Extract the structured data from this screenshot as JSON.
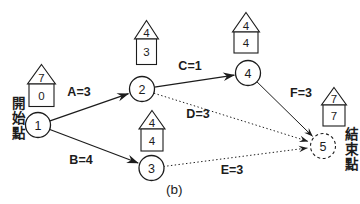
{
  "diagram": {
    "caption": "(b)",
    "start_point_label": "開始點",
    "end_point_label": "結束點",
    "colors": {
      "ink": "#1c1c1c",
      "background": "#ffffff"
    },
    "nodes": [
      {
        "id": "1",
        "house_roof_value": "7",
        "house_body_value": "0",
        "role": "start"
      },
      {
        "id": "2",
        "house_roof_value": "4",
        "house_body_value": "3",
        "role": "intermediate"
      },
      {
        "id": "3",
        "house_roof_value": "4",
        "house_body_value": "4",
        "role": "intermediate"
      },
      {
        "id": "4",
        "house_roof_value": "4",
        "house_body_value": "4",
        "role": "intermediate"
      },
      {
        "id": "5",
        "house_roof_value": "7",
        "house_body_value": "7",
        "role": "end"
      }
    ],
    "edges": [
      {
        "label": "A=3",
        "from": "1",
        "to": "2",
        "style": "solid"
      },
      {
        "label": "B=4",
        "from": "1",
        "to": "3",
        "style": "solid"
      },
      {
        "label": "C=1",
        "from": "2",
        "to": "4",
        "style": "solid"
      },
      {
        "label": "D=3",
        "from": "2",
        "to": "5",
        "style": "dotted"
      },
      {
        "label": "E=3",
        "from": "3",
        "to": "5",
        "style": "dotted"
      },
      {
        "label": "F=3",
        "from": "4",
        "to": "5",
        "style": "solid"
      }
    ]
  }
}
